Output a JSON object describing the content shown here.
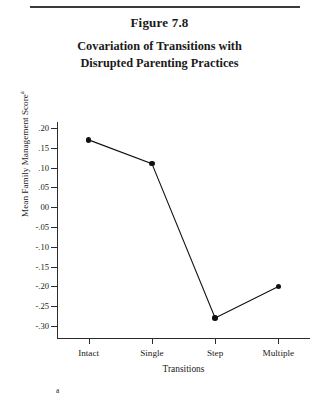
{
  "figure": {
    "number": "Figure 7.8",
    "title_line1": "Covariation of Transitions with",
    "title_line2": "Disrupted Parenting Practices",
    "footnote_marker": "a",
    "superscript_marker": "a",
    "line_color": "#111111",
    "marker_color": "#111111",
    "axis_color": "#2b2b2b",
    "rule_color": "#3a3a3a"
  },
  "chart_data": {
    "type": "line",
    "title": "Covariation of Transitions with Disrupted Parenting Practices",
    "xlabel": "Transitions",
    "ylabel": "Mean Family Management Score",
    "categories": [
      "Intact",
      "Single",
      "Step",
      "Multiple"
    ],
    "values": [
      0.17,
      0.11,
      -0.28,
      -0.2
    ],
    "ylim": [
      -0.3,
      0.2
    ],
    "ytick_labels": [
      ".20",
      ".15",
      ".10",
      ".05",
      "00",
      "-.05",
      "-.10",
      "-.15",
      "-.20",
      "-.25",
      "-.30"
    ],
    "ytick_values": [
      0.2,
      0.15,
      0.1,
      0.05,
      0.0,
      -0.05,
      -0.1,
      -0.15,
      -0.2,
      -0.25,
      -0.3
    ],
    "grid": false,
    "legend": "none",
    "markers": true
  }
}
